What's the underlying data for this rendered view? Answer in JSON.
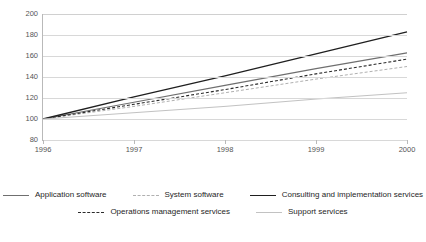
{
  "chart_data": {
    "type": "line",
    "title": "",
    "subtitle": "",
    "xlabel": "",
    "ylabel": "",
    "x": [
      "1996",
      "1997",
      "1998",
      "1999",
      "2000"
    ],
    "categories": [
      "1996",
      "1997",
      "1998",
      "1999",
      "2000"
    ],
    "xticklabels": [
      "1996",
      "1997",
      "1998",
      "1999",
      "2000"
    ],
    "yticklabels": [
      "80",
      "100",
      "120",
      "140",
      "160",
      "180",
      "200"
    ],
    "yticks": [
      80,
      100,
      120,
      140,
      160,
      180,
      200
    ],
    "ylim": [
      80,
      200
    ],
    "grid": "horizontal",
    "legend_position": "bottom",
    "series": [
      {
        "name": "Application software",
        "values": [
          100,
          116,
          132,
          148,
          163
        ],
        "color": "#6f6f6f",
        "style": "solid",
        "width": 1.1
      },
      {
        "name": "System software",
        "values": [
          100,
          112,
          125,
          138,
          150
        ],
        "color": "#b0b0b0",
        "style": "dashed",
        "width": 1.0
      },
      {
        "name": "Consulting and implementation services",
        "values": [
          100,
          121,
          141,
          162,
          183
        ],
        "color": "#1f1f1f",
        "style": "solid",
        "width": 1.3
      },
      {
        "name": "Operations management services",
        "values": [
          100,
          114,
          128,
          143,
          157
        ],
        "color": "#2b2b2b",
        "style": "dashed",
        "width": 1.1
      },
      {
        "name": "Support services",
        "values": [
          100,
          106,
          112,
          119,
          125
        ],
        "color": "#c2c2c2",
        "style": "solid",
        "width": 1.0
      }
    ]
  },
  "legend": {
    "rows": [
      [
        "Application software",
        "System software",
        "Consulting and implementation services"
      ],
      [
        "Operations management services",
        "Support services"
      ]
    ]
  },
  "colors": {
    "axis": "#b9b9b9",
    "grid": "#d8d8d8",
    "tick_text": "#555555",
    "legend_text": "#262626",
    "background": "#ffffff"
  }
}
